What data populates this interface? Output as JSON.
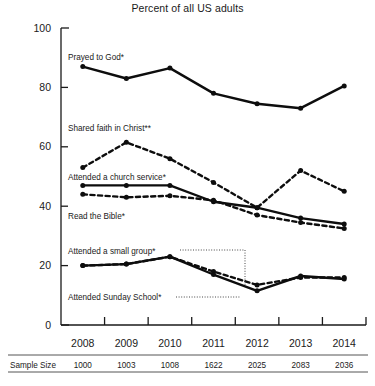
{
  "chart_data": {
    "type": "line",
    "title": "Percent of all US adults",
    "xlabel": "",
    "ylabel": "",
    "ylim": [
      0,
      100
    ],
    "yticks": [
      0,
      20,
      40,
      60,
      80,
      100
    ],
    "grid": false,
    "legend_position": "inline-annotations",
    "categories": [
      "2008",
      "2009",
      "2010",
      "2011",
      "2012",
      "2013",
      "2014"
    ],
    "series": [
      {
        "name": "Prayed to God*",
        "style": "solid",
        "values": [
          87,
          83,
          86.5,
          78,
          74.5,
          73,
          80.5
        ]
      },
      {
        "name": "Shared faith in Christ**",
        "style": "dashed",
        "values": [
          53,
          61.5,
          56,
          48,
          39.5,
          52,
          45
        ]
      },
      {
        "name": "Attended a church service*",
        "style": "solid",
        "values": [
          47,
          47,
          47,
          41.5,
          39.5,
          36,
          34
        ]
      },
      {
        "name": "Read the Bible*",
        "style": "dashed",
        "values": [
          44,
          43,
          43.5,
          42,
          37,
          34.5,
          32.5
        ]
      },
      {
        "name": "Attended a small group*",
        "style": "dashed",
        "values": [
          20,
          20.5,
          23,
          18,
          13.5,
          16,
          16
        ]
      },
      {
        "name": "Attended Sunday School*",
        "style": "solid",
        "values": [
          20,
          20.5,
          23,
          17,
          11.5,
          16.5,
          15.5
        ]
      }
    ],
    "annotations": [
      {
        "text": "Prayed to God*",
        "series": "Prayed to God*"
      },
      {
        "text": "Shared faith in Christ**",
        "series": "Shared faith in Christ**"
      },
      {
        "text": "Attended a church service*",
        "series": "Attended a church service*"
      },
      {
        "text": "Read the Bible*",
        "series": "Read the Bible*"
      },
      {
        "text": "Attended a small group*",
        "series": "Attended a small group*"
      },
      {
        "text": "Attended Sunday School*",
        "series": "Attended Sunday School*"
      }
    ],
    "sample_size": {
      "label": "Sample Size",
      "values": [
        "1000",
        "1003",
        "1008",
        "1622",
        "2025",
        "2083",
        "2036"
      ]
    }
  }
}
